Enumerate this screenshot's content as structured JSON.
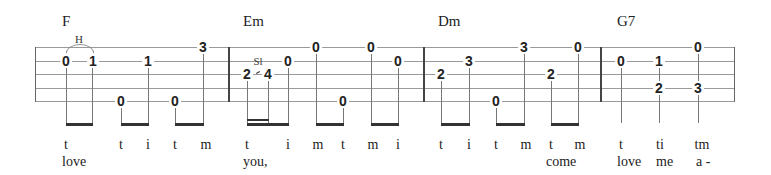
{
  "chords": [
    "F",
    "Em",
    "Dm",
    "G7"
  ],
  "techniques": {
    "hammer": "H",
    "slide": "Sl"
  },
  "fingers": [
    "t",
    "t",
    "i",
    "t",
    "m",
    "t",
    "i",
    "m",
    "t",
    "m",
    "i",
    "t",
    "i",
    "t",
    "m",
    "t",
    "m",
    "t",
    "ti",
    "tm"
  ],
  "lyrics": [
    "love",
    "you,",
    "come",
    "love",
    "me",
    "a -"
  ],
  "frets": {
    "m1": [
      "0",
      "1",
      "1",
      "3",
      "0",
      "0"
    ],
    "m2": [
      "2",
      "4",
      "0",
      "0",
      "0",
      "0",
      "0"
    ],
    "m3": [
      "2",
      "3",
      "3",
      "0",
      "2",
      "0"
    ],
    "m4": [
      "0",
      "1",
      "0",
      "2",
      "3"
    ]
  }
}
